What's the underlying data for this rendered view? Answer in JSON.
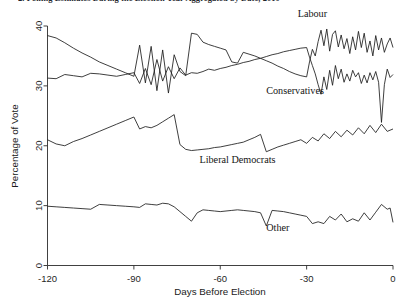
{
  "chart_data": {
    "type": "line",
    "title": "2.   Polling Estimates During the Election Year Aggregated by Date, 2010",
    "xlabel": "Days Before Election",
    "ylabel": "Percentage of Vote",
    "xlim": [
      -120,
      0
    ],
    "ylim": [
      0,
      40
    ],
    "xticks": [
      -120,
      -90,
      -60,
      -30,
      0
    ],
    "xticklabels": [
      "-120",
      "-90",
      "-60",
      "-30",
      "0"
    ],
    "yticks": [
      0,
      10,
      20,
      30,
      40
    ],
    "yticklabels": [
      "0",
      "10",
      "20",
      "30",
      "40"
    ],
    "grid": false,
    "legend_position": "inline-annotations",
    "line_color": "#1c1c1c",
    "series": [
      {
        "name": "Labour",
        "label": "Labour",
        "label_x": -28,
        "label_y": 41.5,
        "x": [
          -120,
          -117,
          -114,
          -111,
          -108,
          -105,
          -102,
          -99,
          -96,
          -93,
          -90,
          -88,
          -86,
          -84,
          -82,
          -80,
          -78,
          -76,
          -74,
          -72,
          -70,
          -68,
          -66,
          -64,
          -62,
          -60,
          -58,
          -56,
          -54,
          -52,
          -50,
          -48,
          -46,
          -44,
          -42,
          -40,
          -38,
          -36,
          -34,
          -32,
          -30,
          -29,
          -28,
          -27,
          -26,
          -25,
          -24,
          -23,
          -22,
          -21,
          -20,
          -19,
          -18,
          -17,
          -16,
          -15,
          -14,
          -13,
          -12,
          -11,
          -10,
          -9,
          -8,
          -7,
          -6,
          -5,
          -4,
          -3,
          -2,
          -1,
          0
        ],
        "y": [
          38.4,
          38.0,
          37.2,
          36.3,
          35.5,
          34.8,
          34.0,
          33.4,
          32.8,
          32.2,
          31.6,
          36.8,
          30.5,
          36.6,
          29.2,
          36.0,
          28.8,
          35.2,
          32.4,
          31.7,
          38.8,
          38.6,
          37.3,
          36.9,
          36.6,
          36.3,
          36.0,
          34.0,
          33.8,
          35.6,
          35.3,
          35.0,
          34.6,
          34.2,
          33.8,
          33.3,
          32.9,
          32.4,
          32.0,
          31.7,
          31.5,
          34.0,
          36.1,
          35.0,
          37.4,
          39.3,
          36.7,
          39.5,
          35.8,
          38.6,
          39.2,
          36.5,
          38.5,
          36.2,
          37.9,
          35.4,
          38.2,
          36.0,
          39.1,
          36.4,
          38.8,
          35.6,
          37.5,
          35.0,
          38.4,
          36.0,
          38.0,
          35.6,
          37.0,
          38.0,
          36.4
        ]
      },
      {
        "name": "Conservatives",
        "label": "Conservatives",
        "label_x": -34,
        "label_y": 28.6,
        "x": [
          -120,
          -117,
          -114,
          -111,
          -108,
          -105,
          -102,
          -99,
          -96,
          -93,
          -90,
          -88,
          -86,
          -84,
          -82,
          -80,
          -78,
          -76,
          -74,
          -72,
          -70,
          -68,
          -66,
          -64,
          -62,
          -60,
          -58,
          -56,
          -54,
          -52,
          -50,
          -48,
          -46,
          -44,
          -42,
          -40,
          -38,
          -36,
          -34,
          -32,
          -30,
          -29,
          -28,
          -27,
          -26,
          -25,
          -24,
          -23,
          -22,
          -21,
          -20,
          -19,
          -18,
          -17,
          -16,
          -15,
          -14,
          -13,
          -12,
          -11,
          -10,
          -9,
          -8,
          -7,
          -6,
          -5,
          -4,
          -3,
          -2,
          -1,
          0
        ],
        "y": [
          31.3,
          31.2,
          31.9,
          31.7,
          31.5,
          32.1,
          32.0,
          31.8,
          31.6,
          31.9,
          32.2,
          30.4,
          32.9,
          30.2,
          34.4,
          30.8,
          33.2,
          31.2,
          33.0,
          31.8,
          32.2,
          32.1,
          32.4,
          32.8,
          32.6,
          32.9,
          33.1,
          33.4,
          33.6,
          33.9,
          34.1,
          34.4,
          34.6,
          34.9,
          35.2,
          35.4,
          35.7,
          35.9,
          36.1,
          36.3,
          36.4,
          34.8,
          33.4,
          32.0,
          30.2,
          28.6,
          31.5,
          29.4,
          32.6,
          30.1,
          33.4,
          31.2,
          32.8,
          30.6,
          32.0,
          30.8,
          32.6,
          31.5,
          32.2,
          30.4,
          31.8,
          30.5,
          32.2,
          31.0,
          32.4,
          30.6,
          23.9,
          30.2,
          32.8,
          31.4,
          31.9
        ]
      },
      {
        "name": "Liberal Democrats",
        "label": "Liberal Democrats",
        "label_x": -54,
        "label_y": 17.1,
        "x": [
          -120,
          -117,
          -114,
          -111,
          -108,
          -105,
          -102,
          -99,
          -96,
          -93,
          -90,
          -88,
          -86,
          -84,
          -82,
          -80,
          -78,
          -76,
          -74,
          -72,
          -70,
          -68,
          -66,
          -64,
          -62,
          -60,
          -58,
          -56,
          -54,
          -52,
          -50,
          -48,
          -46,
          -44,
          -42,
          -40,
          -38,
          -36,
          -34,
          -32,
          -30,
          -28,
          -26,
          -24,
          -22,
          -20,
          -18,
          -16,
          -14,
          -12,
          -10,
          -8,
          -6,
          -4,
          -2,
          0
        ],
        "y": [
          21.0,
          20.3,
          20.0,
          20.7,
          21.2,
          21.8,
          22.4,
          23.0,
          23.6,
          24.2,
          24.8,
          22.8,
          23.2,
          23.0,
          23.4,
          24.0,
          24.6,
          25.2,
          20.2,
          19.4,
          19.2,
          19.3,
          19.4,
          19.5,
          19.7,
          19.8,
          20.0,
          20.2,
          20.4,
          20.6,
          21.0,
          21.4,
          21.9,
          19.0,
          19.4,
          19.8,
          20.1,
          20.4,
          20.7,
          21.0,
          20.4,
          21.4,
          20.8,
          22.0,
          21.2,
          22.4,
          21.5,
          22.6,
          21.8,
          23.0,
          22.0,
          23.4,
          22.2,
          23.6,
          22.4,
          22.8
        ]
      },
      {
        "name": "Other",
        "label": "Other",
        "label_x": -40,
        "label_y": 5.7,
        "x": [
          -120,
          -117,
          -114,
          -111,
          -108,
          -105,
          -102,
          -99,
          -96,
          -93,
          -90,
          -88,
          -86,
          -84,
          -82,
          -80,
          -78,
          -76,
          -74,
          -72,
          -70,
          -68,
          -66,
          -64,
          -62,
          -60,
          -58,
          -56,
          -54,
          -52,
          -50,
          -48,
          -46,
          -44,
          -42,
          -40,
          -38,
          -36,
          -34,
          -32,
          -30,
          -28,
          -26,
          -24,
          -22,
          -20,
          -18,
          -16,
          -14,
          -12,
          -10,
          -8,
          -6,
          -4,
          -2,
          -1,
          0
        ],
        "y": [
          9.9,
          9.8,
          9.7,
          9.6,
          9.5,
          9.4,
          10.2,
          10.1,
          10.0,
          9.9,
          9.8,
          9.7,
          10.3,
          10.2,
          10.1,
          10.4,
          10.3,
          9.8,
          9.0,
          8.2,
          7.4,
          8.8,
          9.3,
          9.2,
          9.1,
          9.0,
          9.1,
          9.2,
          9.3,
          9.2,
          9.1,
          9.0,
          8.8,
          6.6,
          9.2,
          9.1,
          9.0,
          8.8,
          8.6,
          8.4,
          8.2,
          7.0,
          7.3,
          7.0,
          8.2,
          7.6,
          8.6,
          7.3,
          7.8,
          7.4,
          8.8,
          7.6,
          8.9,
          10.2,
          9.4,
          9.6,
          7.2
        ]
      }
    ]
  },
  "axes": {
    "y_axis_title": "Percentage of Vote",
    "x_axis_title": "Days Before Election"
  }
}
